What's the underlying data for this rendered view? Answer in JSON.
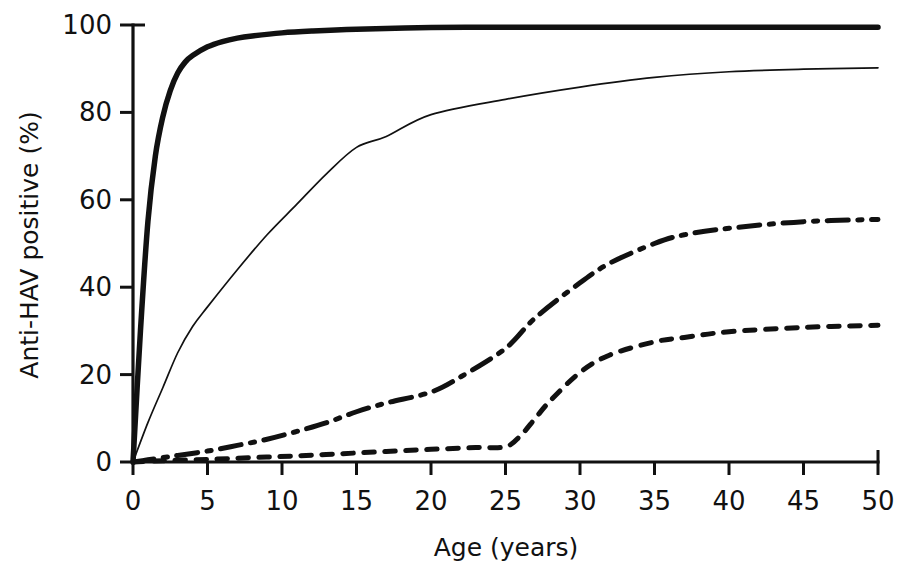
{
  "chart_data": {
    "type": "line",
    "title": "",
    "subtitle": "",
    "xlabel": "Age (years)",
    "ylabel": "Anti-HAV positive (%)",
    "xlim": [
      0,
      50
    ],
    "ylim": [
      0,
      100
    ],
    "xticks": [
      0,
      5,
      10,
      15,
      20,
      25,
      30,
      35,
      40,
      45,
      50
    ],
    "xticklabels": [
      "0",
      "5",
      "10",
      "15",
      "20",
      "25",
      "30",
      "35",
      "40",
      "45",
      "50"
    ],
    "yticks": [
      0,
      20,
      40,
      60,
      80,
      100
    ],
    "yticklabels": [
      "0",
      "20",
      "40",
      "60",
      "80",
      "100"
    ],
    "grid": false,
    "legend": "none",
    "annotations": [],
    "series": [
      {
        "name": "thick-solid-curve",
        "style": "solid",
        "linewidth": 5.5,
        "color": "#111111",
        "x": [
          0,
          0.5,
          1,
          1.5,
          2,
          2.5,
          3,
          3.5,
          4,
          5,
          6,
          7,
          8,
          10,
          12,
          15,
          20,
          25,
          30,
          35,
          40,
          45,
          50
        ],
        "y": [
          0,
          30,
          55,
          70,
          79,
          85,
          89,
          91.5,
          93,
          95,
          96.2,
          97,
          97.5,
          98.2,
          98.6,
          99,
          99.4,
          99.5,
          99.5,
          99.5,
          99.5,
          99.5,
          99.5
        ]
      },
      {
        "name": "thin-solid-curve",
        "style": "solid",
        "linewidth": 1.7,
        "color": "#111111",
        "x": [
          0,
          1,
          2,
          3,
          4,
          5,
          7,
          9,
          11,
          13,
          15,
          17,
          20,
          25,
          30,
          35,
          40,
          45,
          50
        ],
        "y": [
          0,
          9,
          17,
          25,
          31,
          35.5,
          44,
          52,
          59,
          66,
          72,
          74.5,
          79.5,
          83,
          85.8,
          88,
          89.3,
          89.9,
          90.2
        ]
      },
      {
        "name": "dash-dot-curve",
        "style": "dashdot",
        "linewidth": 5.0,
        "color": "#111111",
        "x": [
          0,
          1,
          2,
          3,
          5,
          7,
          9,
          11,
          13,
          15,
          17,
          20,
          22,
          25,
          27,
          30,
          32,
          35,
          37,
          40,
          45,
          50
        ],
        "y": [
          0,
          0.5,
          1,
          1.5,
          2.5,
          3.8,
          5.2,
          7,
          9,
          11.5,
          13.5,
          16,
          19.5,
          26,
          33,
          41,
          45.5,
          50,
          52,
          53.5,
          55,
          55.5
        ]
      },
      {
        "name": "dotted-curve",
        "style": "dotted",
        "linewidth": 5.0,
        "color": "#111111",
        "x": [
          0,
          2,
          5,
          8,
          11,
          14,
          17,
          20,
          23,
          25,
          26,
          27,
          28,
          30,
          32,
          35,
          37,
          40,
          45,
          50
        ],
        "y": [
          0,
          0.3,
          0.6,
          1.0,
          1.4,
          1.9,
          2.4,
          2.9,
          3.3,
          3.5,
          6.0,
          10.0,
          14.0,
          20.5,
          24.5,
          27.5,
          28.5,
          29.8,
          30.8,
          31.3
        ]
      }
    ]
  },
  "axes": {
    "x_title": "Age (years)",
    "y_title": "Anti-HAV positive (%)"
  }
}
